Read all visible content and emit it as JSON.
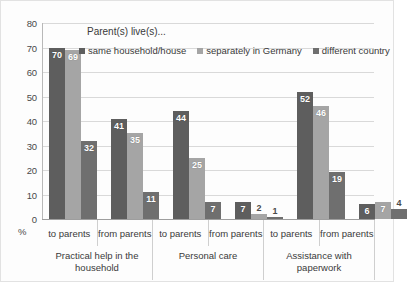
{
  "chart_data": {
    "type": "bar",
    "title": "",
    "legend_title": "Parent(s) live(s)...",
    "legend_position": "top",
    "xlabel": "",
    "ylabel": "%",
    "ylim": [
      0,
      80
    ],
    "ytick_labels": [
      "80",
      "70",
      "60",
      "50",
      "40",
      "30",
      "20",
      "10",
      "0"
    ],
    "yticks": [
      80,
      70,
      60,
      50,
      40,
      30,
      20,
      10,
      0
    ],
    "grid": true,
    "categories": [
      "to parents",
      "from parents",
      "to parents",
      "from parents",
      "to parents",
      "from parents"
    ],
    "category_groups": [
      {
        "label": "Practical help in the household",
        "span": 2
      },
      {
        "label": "Personal care",
        "span": 2
      },
      {
        "label": "Assistance with paperwork",
        "span": 2
      }
    ],
    "series": [
      {
        "name": "same household/house",
        "color": "#5e5e5e",
        "values": [
          70,
          41,
          44,
          7,
          52,
          6
        ]
      },
      {
        "name": "separately in Germany",
        "color": "#a5a5a5",
        "values": [
          69,
          35,
          25,
          2,
          46,
          7
        ]
      },
      {
        "name": "different country",
        "color": "#6f6f6f",
        "values": [
          32,
          11,
          7,
          1,
          19,
          4
        ]
      }
    ]
  }
}
